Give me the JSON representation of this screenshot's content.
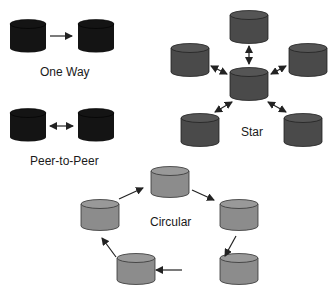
{
  "diagram": {
    "colors": {
      "one_way": "#141414",
      "peer": "#141414",
      "star": "#4a4a4a",
      "circular": "#8c8c8c",
      "arrow": "#222222"
    },
    "groups": [
      {
        "id": "one-way",
        "label": "One Way",
        "nodes": 2,
        "arrows": "single-direction"
      },
      {
        "id": "peer-to-peer",
        "label": "Peer-to-Peer",
        "nodes": 2,
        "arrows": "bidirectional"
      },
      {
        "id": "star",
        "label": "Star",
        "nodes": 6,
        "arrows": "bidirectional-to-center"
      },
      {
        "id": "circular",
        "label": "Circular",
        "nodes": 5,
        "arrows": "clockwise-ring"
      }
    ]
  },
  "labels": {
    "one_way": "One Way",
    "peer": "Peer-to-Peer",
    "star": "Star",
    "circular": "Circular"
  }
}
